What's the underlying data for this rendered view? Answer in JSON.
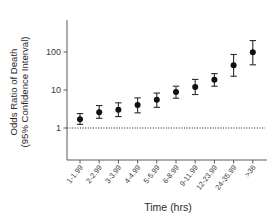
{
  "chart_data": {
    "type": "scatter",
    "title": "",
    "xlabel": "Time (hrs)",
    "ylabel": "Odds Ratio of Death\n(95% Confidence Interval)",
    "ylabel_line1": "Odds Ratio of Death",
    "ylabel_line2": "(95% Confidence Interval)",
    "yscale": "log",
    "ylim": [
      0.55,
      330
    ],
    "ytick_labels": [
      "1",
      "10",
      "100"
    ],
    "ytick_values": [
      1,
      10,
      100
    ],
    "grid": false,
    "legend": null,
    "reference_line": {
      "value": 1,
      "style": "dotted",
      "label": ""
    },
    "categories": [
      "1-1.99",
      "2-2.99",
      "3-3.99",
      "4-4.99",
      "5-5.99",
      "6-8.99",
      "9-11.99",
      "12-23.99",
      "24-35.99",
      ">36"
    ],
    "values": [
      1.7,
      2.6,
      3.0,
      4.0,
      5.5,
      8.8,
      12.0,
      18.5,
      45.0,
      98.0
    ],
    "ci_lower": [
      1.25,
      1.8,
      2.0,
      2.5,
      3.5,
      6.1,
      7.6,
      12.6,
      23.0,
      46.0
    ],
    "ci_upper": [
      2.4,
      3.9,
      4.6,
      6.2,
      8.3,
      12.6,
      19.0,
      27.0,
      86.0,
      200.0
    ],
    "series": [
      {
        "name": "Odds Ratio of Death",
        "values": [
          1.7,
          2.6,
          3.0,
          4.0,
          5.5,
          8.8,
          12.0,
          18.5,
          45.0,
          98.0
        ]
      }
    ]
  }
}
